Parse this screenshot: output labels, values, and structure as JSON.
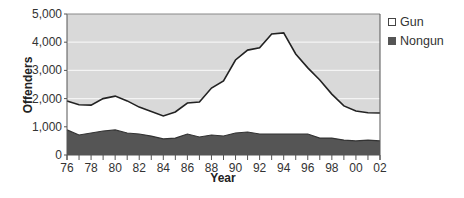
{
  "chart_data": {
    "type": "area",
    "stacked": false,
    "title": "",
    "xlabel": "Year",
    "ylabel": "Offenders",
    "ylim": [
      0,
      5000
    ],
    "yticks": [
      0,
      1000,
      2000,
      3000,
      4000,
      5000
    ],
    "ytick_labels": [
      "0",
      "1,000",
      "2,000",
      "3,000",
      "4,000",
      "5,000"
    ],
    "xtick_labels": [
      "76",
      "78",
      "80",
      "82",
      "84",
      "86",
      "88",
      "90",
      "92",
      "94",
      "96",
      "98",
      "00",
      "02"
    ],
    "grid": "horizontal",
    "legend_position": "right-top",
    "x": [
      "76",
      "77",
      "78",
      "79",
      "80",
      "81",
      "82",
      "83",
      "84",
      "85",
      "86",
      "87",
      "88",
      "89",
      "90",
      "91",
      "92",
      "93",
      "94",
      "95",
      "96",
      "97",
      "98",
      "99",
      "00",
      "01",
      "02"
    ],
    "series": [
      {
        "name": "Gun",
        "color": "#ffffff",
        "values": [
          1920,
          1780,
          1770,
          2000,
          2090,
          1920,
          1700,
          1540,
          1385,
          1525,
          1845,
          1880,
          2375,
          2625,
          3370,
          3720,
          3800,
          4290,
          4330,
          3580,
          3090,
          2660,
          2160,
          1740,
          1560,
          1500,
          1490
        ]
      },
      {
        "name": "Nongun",
        "color": "#555555",
        "values": [
          890,
          710,
          780,
          850,
          890,
          780,
          745,
          670,
          570,
          600,
          745,
          640,
          710,
          675,
          780,
          815,
          745,
          745,
          745,
          745,
          745,
          600,
          600,
          530,
          500,
          530,
          500
        ]
      }
    ],
    "note": "Gun values are the total (top) line; Nongun area is drawn in front from 0."
  },
  "legend": {
    "items": [
      {
        "label": "Gun",
        "swatch": "gun"
      },
      {
        "label": "Nongun",
        "swatch": "nongun"
      }
    ]
  },
  "colors": {
    "plot_background": "#d9d9d9",
    "gridline": "#f4f4f4",
    "gun_fill": "#ffffff",
    "nongun_fill": "#555555",
    "line": "#222222",
    "axis": "#555555"
  }
}
